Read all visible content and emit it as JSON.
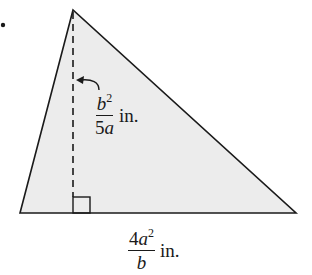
{
  "figure": {
    "type": "triangle-area",
    "fill_color": "#ececec",
    "stroke_color": "#1a1a1a",
    "vertices": {
      "apex": [
        73,
        10
      ],
      "base_left": [
        20,
        213
      ],
      "base_right": [
        296,
        213
      ]
    },
    "altitude": {
      "style": "dashed",
      "from": [
        73,
        10
      ],
      "to": [
        73,
        213
      ],
      "right_angle_marker": true
    },
    "bullet": [
      3,
      25
    ]
  },
  "labels": {
    "height": {
      "numerator_var": "b",
      "numerator_exp": "2",
      "denominator_coef": "5",
      "denominator_var": "a",
      "unit": "in."
    },
    "base": {
      "numerator_coef": "4",
      "numerator_var": "a",
      "numerator_exp": "2",
      "denominator_var": "b",
      "unit": "in."
    }
  }
}
